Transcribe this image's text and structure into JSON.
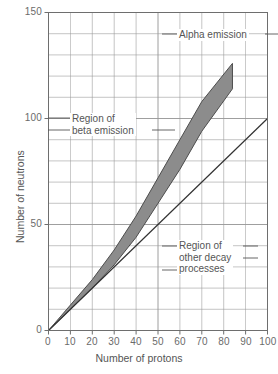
{
  "chart_data": {
    "type": "line",
    "title": "",
    "xlabel": "Number of protons",
    "ylabel": "Number of neutrons",
    "xlim": [
      0,
      100
    ],
    "ylim": [
      0,
      150
    ],
    "xticks": [
      0,
      10,
      20,
      30,
      40,
      50,
      60,
      70,
      80,
      90,
      100
    ],
    "yticks": [
      0,
      50,
      100,
      150
    ],
    "grid": true,
    "grid_step_x": 10,
    "grid_step_y": 10,
    "legend": "none",
    "series": [
      {
        "name": "N = Z line",
        "type": "line",
        "color": "#333333",
        "x": [
          0,
          100
        ],
        "values": [
          0,
          100
        ]
      },
      {
        "name": "Band of stability (upper edge)",
        "type": "line",
        "color": "#4d4d4d",
        "x": [
          0,
          10,
          20,
          30,
          40,
          50,
          60,
          70,
          84
        ],
        "values": [
          0,
          12,
          24,
          38,
          54,
          72,
          90,
          108,
          126
        ]
      },
      {
        "name": "Band of stability (lower edge)",
        "type": "line",
        "color": "#4d4d4d",
        "x": [
          0,
          10,
          20,
          30,
          40,
          50,
          60,
          70,
          84
        ],
        "values": [
          0,
          10,
          20,
          31,
          44,
          60,
          76,
          94,
          114
        ]
      }
    ],
    "shaded_region": {
      "name": "belt-of-stability-band",
      "fill": "#8c8c8c",
      "stroke": "#4d4d4d",
      "upper_x": [
        0,
        10,
        20,
        30,
        40,
        50,
        60,
        70,
        84
      ],
      "upper_y": [
        0,
        12,
        24,
        38,
        54,
        72,
        90,
        108,
        126
      ],
      "lower_x": [
        0,
        10,
        20,
        30,
        40,
        50,
        60,
        70,
        84
      ],
      "lower_y": [
        0,
        10,
        20,
        31,
        44,
        60,
        76,
        94,
        114
      ]
    },
    "annotations": [
      {
        "name": "alpha-emission",
        "lines": [
          "Alpha emission"
        ],
        "x": 62,
        "y": 139
      },
      {
        "name": "beta-emission",
        "lines": [
          "Region of",
          "beta emission"
        ],
        "x": 12,
        "y": 104
      },
      {
        "name": "other-decay",
        "lines": [
          "Region of",
          "other decay",
          "processes"
        ],
        "x": 62,
        "y": 46
      }
    ]
  },
  "axes": {
    "x": {
      "title": "Number of protons",
      "tick_labels": [
        "0",
        "10",
        "20",
        "30",
        "40",
        "50",
        "60",
        "70",
        "80",
        "90",
        "100"
      ]
    },
    "y": {
      "title": "Number of neutrons",
      "tick_labels": [
        "0",
        "50",
        "100",
        "150"
      ]
    }
  },
  "annotation_text": {
    "alpha": "Alpha emission",
    "beta_line1": "Region of",
    "beta_line2": "beta emission",
    "other_line1": "Region of",
    "other_line2": "other decay",
    "other_line3": "processes"
  },
  "colors": {
    "band_fill": "#8c8c8c",
    "band_stroke": "#4d4d4d",
    "nz_line": "#333333",
    "grid": "#9a9a9a",
    "frame": "#6e6e6e",
    "text": "#555555"
  }
}
